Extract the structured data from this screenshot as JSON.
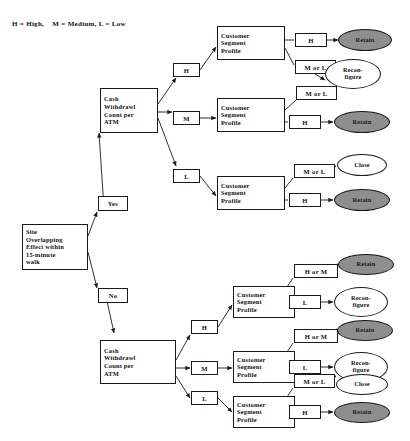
{
  "diagram": {
    "legend": "H = High,    M = Medium, L = Low",
    "colors": {
      "stroke": "#1a1a1a",
      "shaded_fill": "#8e8e8e",
      "white_fill": "#ffffff",
      "text": "#111111"
    },
    "root": {
      "label": "Site\nOverlapping\nEffect within\n15-minute\nwalk"
    },
    "branch_labels": {
      "yes": "Yes",
      "no": "No",
      "high": "H",
      "medium": "M",
      "low": "L",
      "m_or_l": "M or L",
      "h_or_m": "H or M"
    },
    "driver_nodes": [
      {
        "id": "cash-top",
        "label": "Cash\nWithdrawl\nCount per\nATM"
      },
      {
        "id": "cash-bottom",
        "label": "Cash\nWithdrawl\nCount per\nATM"
      }
    ],
    "segment_nodes": [
      {
        "id": "csp-1",
        "label": "Customer\nSegment\nProfile"
      },
      {
        "id": "csp-2",
        "label": "Customer\nSegment\nProfile"
      },
      {
        "id": "csp-3",
        "label": "Customer\nSegment\nProfile"
      },
      {
        "id": "csp-4",
        "label": "Customer\nSegment\nProfile"
      },
      {
        "id": "csp-5",
        "label": "Customer\nSegment\nProfile"
      },
      {
        "id": "csp-6",
        "label": "Customer\nSegment\nProfile"
      }
    ],
    "outcomes": [
      {
        "id": "out-1",
        "label": "Retain",
        "fill": "shaded"
      },
      {
        "id": "out-2",
        "label": "Recon-\nfigure",
        "fill": "white"
      },
      {
        "id": "out-3",
        "label": "Retain",
        "fill": "shaded"
      },
      {
        "id": "out-4",
        "label": "Close",
        "fill": "white"
      },
      {
        "id": "out-5",
        "label": "Retain",
        "fill": "shaded"
      },
      {
        "id": "out-6",
        "label": "Retain",
        "fill": "shaded"
      },
      {
        "id": "out-7",
        "label": "Recon-\nfigure",
        "fill": "white"
      },
      {
        "id": "out-8",
        "label": "Retain",
        "fill": "shaded"
      },
      {
        "id": "out-9",
        "label": "Recon-\nfigure",
        "fill": "white"
      },
      {
        "id": "out-10",
        "label": "Close",
        "fill": "white"
      },
      {
        "id": "out-11",
        "label": "Retain",
        "fill": "shaded"
      }
    ],
    "edge_labels_top": {
      "csp1_a": "H",
      "csp1_b": "M or L",
      "csp2_a": "M or L",
      "csp2_b": "H",
      "csp3_a": "M or L",
      "csp3_b": "H"
    },
    "edge_labels_bottom": {
      "csp4_a": "H or M",
      "csp4_b": "L",
      "csp5_a": "H or M",
      "csp5_b": "L",
      "csp6_a": "M or L",
      "csp6_b": "H"
    }
  }
}
